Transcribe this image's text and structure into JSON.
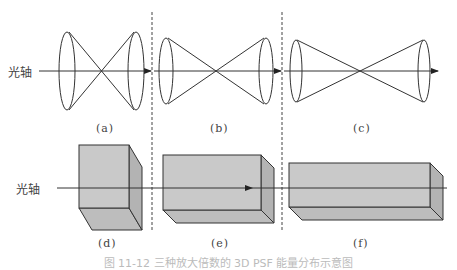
{
  "figure": {
    "axis_label_top": "光轴",
    "axis_label_bottom": "光轴",
    "caption": "图 11-12  三种放大倍数的 3D PSF 能量分布示意图",
    "colors": {
      "line": "#333333",
      "dash": "#444444",
      "box_front": "#c9c9c9",
      "box_side": "#b3b3b3",
      "box_bottom": "#bdbdbd"
    },
    "panels": [
      {
        "id": "a",
        "label": "(a)",
        "type": "double-cone",
        "description": "short wide double cone"
      },
      {
        "id": "b",
        "label": "(b)",
        "type": "double-cone",
        "description": "medium double cone"
      },
      {
        "id": "c",
        "label": "(c)",
        "type": "double-cone",
        "description": "long narrow double cone"
      },
      {
        "id": "d",
        "label": "(d)",
        "type": "box",
        "description": "tall short box"
      },
      {
        "id": "e",
        "label": "(e)",
        "type": "box",
        "description": "medium box"
      },
      {
        "id": "f",
        "label": "(f)",
        "type": "box",
        "description": "long flat box"
      }
    ]
  }
}
